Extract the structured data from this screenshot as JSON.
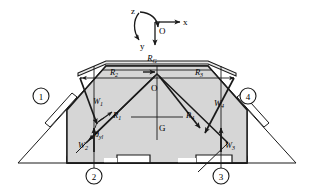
{
  "figure": {
    "type": "engineering-free-body-diagram",
    "background": "#ffffff",
    "ink": "#1a1a1a",
    "body_fill": "#d6d6d6",
    "pad_fill": "#ffffff",
    "width": 314,
    "height": 189
  },
  "coordinate_frame": {
    "origin_label": "O",
    "x_axis_label": "x",
    "y_axis_label": "y",
    "z_axis_label": "z",
    "x_direction": "right",
    "y_direction": "down",
    "z_direction": "counter-clockwise-rotation"
  },
  "points": {
    "origin": "O",
    "center_of_gravity": "G"
  },
  "support_nodes": [
    {
      "id": "1",
      "label": "1",
      "position": "upper-left"
    },
    {
      "id": "2",
      "label": "2",
      "position": "lower-left"
    },
    {
      "id": "3",
      "label": "3",
      "position": "lower-right"
    },
    {
      "id": "4",
      "label": "4",
      "position": "upper-right"
    }
  ],
  "reaction_forces": [
    {
      "name": "R1",
      "base": "R",
      "sub": "1",
      "position": "inner-left-diagonal"
    },
    {
      "name": "R2",
      "base": "R",
      "sub": "2",
      "position": "top-left-span"
    },
    {
      "name": "R3",
      "base": "R",
      "sub": "3",
      "position": "top-right-span"
    },
    {
      "name": "R4",
      "base": "R",
      "sub": "4",
      "position": "inner-right-diagonal"
    },
    {
      "name": "RG",
      "base": "R",
      "sub": "G",
      "position": "top-overall-span"
    }
  ],
  "load_forces": [
    {
      "name": "W1",
      "base": "W",
      "sub": "1",
      "position": "upper-left",
      "direction": "down-left"
    },
    {
      "name": "W2",
      "base": "W",
      "sub": "2",
      "position": "lower-left",
      "direction": "up"
    },
    {
      "name": "W3",
      "base": "W",
      "sub": "3",
      "position": "lower-right",
      "direction": "up"
    },
    {
      "name": "W4",
      "base": "W",
      "sub": "4",
      "position": "upper-right",
      "direction": "down-left"
    }
  ],
  "angles": [
    {
      "name": "theta_yl",
      "base": "θ",
      "sub": "yl",
      "position": "left-inner-slope"
    }
  ]
}
